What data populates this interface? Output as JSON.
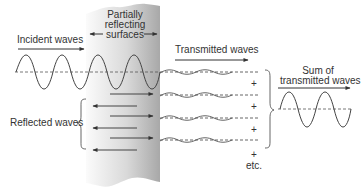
{
  "diagram": {
    "type": "wave-reflection-transmission",
    "colors": {
      "stroke": "#444444",
      "text": "#333333",
      "plate_light": "#fbfbfb",
      "plate_dark": "#a9a9a9"
    },
    "labels": {
      "incident": "Incident waves",
      "surfaces_line1": "Partially",
      "surfaces_line2": "reflecting",
      "surfaces_line3": "surfaces",
      "transmitted": "Transmitted waves",
      "reflected": "Reflected waves",
      "sum_line1": "Sum of",
      "sum_line2": "transmitted waves",
      "plus": "+",
      "etc": "etc."
    },
    "transmitted_wave_count": 4,
    "reflected_arrow_count": 3,
    "forward_arrow_count_inside_plate": 3
  }
}
